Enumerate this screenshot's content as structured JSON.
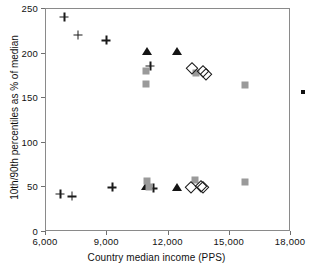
{
  "chart_data": {
    "type": "scatter",
    "title": "",
    "xlabel": "Country median income (PPS)",
    "ylabel": "10th/90th percentiles as % of median",
    "xlim": [
      6000,
      18000
    ],
    "ylim": [
      0,
      250
    ],
    "xticks": [
      6000,
      9000,
      12000,
      15000,
      18000
    ],
    "xtick_labels": [
      "6,000",
      "9,000",
      "12,000",
      "15,000",
      "18,000"
    ],
    "yticks": [
      0,
      50,
      100,
      150,
      200,
      250
    ],
    "ytick_labels": [
      "0",
      "50",
      "100",
      "150",
      "200",
      "250"
    ],
    "grid": false,
    "legend": "none",
    "series": [
      {
        "name": "plus",
        "marker": "plus",
        "color": "#1a1a1a",
        "points": [
          {
            "x": 6900,
            "y": 241
          },
          {
            "x": 7550,
            "y": 221
          },
          {
            "x": 8950,
            "y": 215
          },
          {
            "x": 11100,
            "y": 186
          },
          {
            "x": 6700,
            "y": 43
          },
          {
            "x": 7250,
            "y": 40
          },
          {
            "x": 9250,
            "y": 50
          },
          {
            "x": 11250,
            "y": 49
          }
        ]
      },
      {
        "name": "triangle",
        "marker": "triangle",
        "color": "#141414",
        "points": [
          {
            "x": 10950,
            "y": 203
          },
          {
            "x": 12400,
            "y": 203
          },
          {
            "x": 10900,
            "y": 52
          },
          {
            "x": 12400,
            "y": 50
          }
        ]
      },
      {
        "name": "square",
        "marker": "square",
        "color": "#9a9a9a",
        "points": [
          {
            "x": 10900,
            "y": 180
          },
          {
            "x": 10900,
            "y": 166
          },
          {
            "x": 13350,
            "y": 178
          },
          {
            "x": 15750,
            "y": 165
          },
          {
            "x": 10950,
            "y": 57
          },
          {
            "x": 11050,
            "y": 50
          },
          {
            "x": 13300,
            "y": 58
          },
          {
            "x": 15750,
            "y": 56
          }
        ]
      },
      {
        "name": "diamond",
        "marker": "diamond",
        "color": "#1a1a1a",
        "points": [
          {
            "x": 13150,
            "y": 184
          },
          {
            "x": 13700,
            "y": 180
          },
          {
            "x": 13850,
            "y": 177
          },
          {
            "x": 13100,
            "y": 50
          },
          {
            "x": 13600,
            "y": 52
          },
          {
            "x": 13700,
            "y": 51
          }
        ]
      }
    ]
  }
}
